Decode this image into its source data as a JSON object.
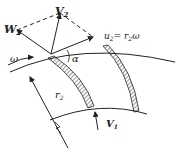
{
  "diagram": {
    "title": "",
    "labels": {
      "V2": {
        "main": "V",
        "sub": "2"
      },
      "W2": {
        "main": "W",
        "sub": "2"
      },
      "u2": {
        "main": "u",
        "sub": "2",
        "eq": "= r",
        "sub2": "2",
        "tail": "ω"
      },
      "omega": "ω",
      "alpha": "α",
      "r2": {
        "main": "r",
        "sub": "2"
      },
      "V1": {
        "main": "V",
        "sub": "1"
      }
    },
    "colors": {
      "stroke": "#222222",
      "background": "#ffffff"
    }
  }
}
